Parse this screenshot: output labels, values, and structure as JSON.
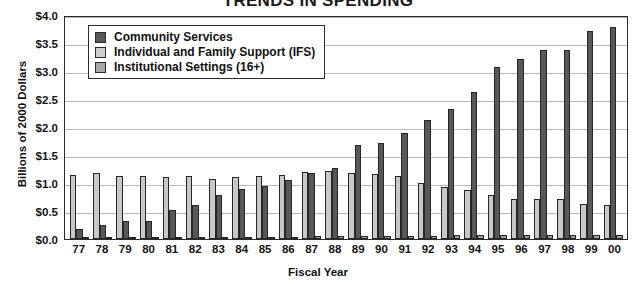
{
  "chart_data": {
    "type": "bar",
    "title": "TRENDS IN SPENDING",
    "xlabel": "Fiscal Year",
    "ylabel": "Billions of 2000 Dollars",
    "ylim": [
      0.0,
      4.0
    ],
    "ytick_step": 0.5,
    "ytick_labels": [
      "$4.0",
      "$3.5",
      "$3.0",
      "$2.5",
      "$2.0",
      "$1.5",
      "$1.0",
      "$0.5",
      "$0.0"
    ],
    "ytick_values": [
      4.0,
      3.5,
      3.0,
      2.5,
      2.0,
      1.5,
      1.0,
      0.5,
      0.0
    ],
    "grid": true,
    "legend_position": "upper-left-inside",
    "categories": [
      "77",
      "78",
      "79",
      "80",
      "81",
      "82",
      "83",
      "84",
      "85",
      "86",
      "87",
      "88",
      "89",
      "90",
      "91",
      "92",
      "93",
      "94",
      "95",
      "96",
      "97",
      "98",
      "99",
      "00"
    ],
    "series": [
      {
        "name": "Institutional Settings (16+)",
        "color": "#c8c8c8",
        "values": [
          1.15,
          1.17,
          1.13,
          1.13,
          1.1,
          1.12,
          1.08,
          1.1,
          1.13,
          1.15,
          1.2,
          1.22,
          1.18,
          1.16,
          1.12,
          1.0,
          0.93,
          0.88,
          0.78,
          0.72,
          0.71,
          0.71,
          0.63,
          0.6
        ]
      },
      {
        "name": "Community Services",
        "color": "#585858",
        "values": [
          0.18,
          0.25,
          0.33,
          0.32,
          0.52,
          0.6,
          0.78,
          0.9,
          0.95,
          1.06,
          1.18,
          1.27,
          1.68,
          1.72,
          1.9,
          2.13,
          2.32,
          2.63,
          3.08,
          3.22,
          3.38,
          3.38,
          3.72,
          3.79
        ]
      },
      {
        "name": "Individual and Family Support (IFS)",
        "color": "#a0a0a0",
        "values": [
          0.04,
          0.04,
          0.04,
          0.04,
          0.04,
          0.04,
          0.04,
          0.04,
          0.04,
          0.04,
          0.05,
          0.05,
          0.05,
          0.05,
          0.06,
          0.06,
          0.07,
          0.07,
          0.07,
          0.07,
          0.07,
          0.08,
          0.08,
          0.08
        ]
      }
    ],
    "legend_entries": [
      {
        "label": "Community Services",
        "swatch": "cs"
      },
      {
        "label": "Individual and Family Support (IFS)",
        "swatch": "ifs"
      },
      {
        "label": "Institutional Settings (16+)",
        "swatch": "inst"
      }
    ]
  }
}
